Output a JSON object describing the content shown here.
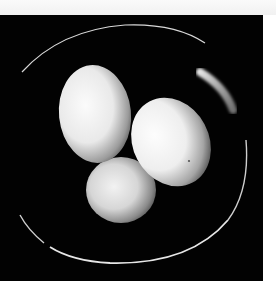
{
  "photo": {
    "subject": "three white eggs in a dark bowl",
    "background_color": "#020202",
    "page_color": "#ffffff",
    "egg_color": "#f4f4f4",
    "egg_shadow_color": "#6e6e6e",
    "rim_highlight_color": "#e8e8e8",
    "egg_count": 3
  }
}
